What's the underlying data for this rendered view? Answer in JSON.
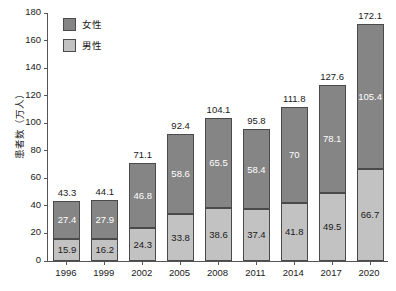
{
  "chart_data": {
    "type": "bar",
    "stacked": true,
    "title": "",
    "xlabel": "",
    "ylabel": "患者数（万人）",
    "ylim": [
      0,
      180
    ],
    "ytick_step": 20,
    "yticks": [
      "0",
      "20",
      "40",
      "60",
      "80",
      "100",
      "120",
      "140",
      "160",
      "180"
    ],
    "grid": false,
    "legend_position": "top-left",
    "categories": [
      "1996",
      "1999",
      "2002",
      "2005",
      "2008",
      "2011",
      "2014",
      "2017",
      "2020"
    ],
    "series": [
      {
        "name": "女性",
        "color": "#858585",
        "values": [
          27.4,
          27.9,
          46.8,
          58.6,
          65.5,
          58.4,
          70,
          78.1,
          105.4
        ],
        "labels": [
          "27.4",
          "27.9",
          "46.8",
          "58.6",
          "65.5",
          "58.4",
          "70",
          "78.1",
          "105.4"
        ]
      },
      {
        "name": "男性",
        "color": "#c2c2c2",
        "values": [
          15.9,
          16.2,
          24.3,
          33.8,
          38.6,
          37.4,
          41.8,
          49.5,
          66.7
        ],
        "labels": [
          "15.9",
          "16.2",
          "24.3",
          "33.8",
          "38.6",
          "37.4",
          "41.8",
          "49.5",
          "66.7"
        ]
      }
    ],
    "totals": [
      43.3,
      44.1,
      71.1,
      92.4,
      104.1,
      95.8,
      111.8,
      127.6,
      172.1
    ],
    "total_labels": [
      "43.3",
      "44.1",
      "71.1",
      "92.4",
      "104.1",
      "95.8",
      "111.8",
      "127.6",
      "172.1"
    ]
  },
  "legend": {
    "items": [
      {
        "label": "女性",
        "color": "#858585"
      },
      {
        "label": "男性",
        "color": "#c2c2c2"
      }
    ]
  },
  "colors": {
    "female": "#858585",
    "male": "#c2c2c2",
    "axis": "#555555",
    "background": "#ffffff",
    "text": "#1a1a1a"
  }
}
